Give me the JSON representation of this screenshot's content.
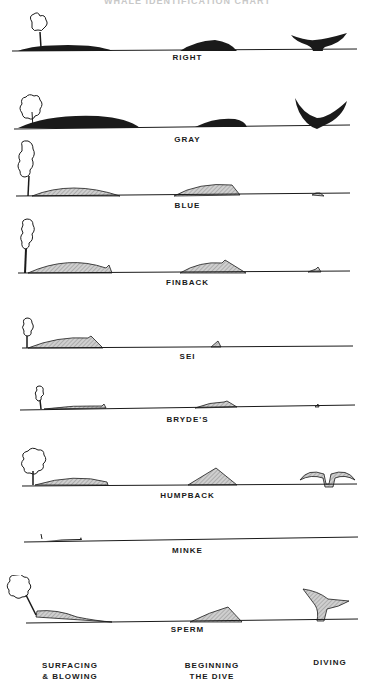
{
  "title": "WHALE IDENTIFICATION CHART",
  "species": [
    {
      "name": "RIGHT"
    },
    {
      "name": "GRAY"
    },
    {
      "name": "BLUE"
    },
    {
      "name": "FINBACK"
    },
    {
      "name": "SEI"
    },
    {
      "name": "BRYDE'S"
    },
    {
      "name": "HUMPBACK"
    },
    {
      "name": "MINKE"
    },
    {
      "name": "SPERM"
    }
  ],
  "stages": [
    {
      "label_line1": "SURFACING",
      "label_line2": "& BLOWING"
    },
    {
      "label_line1": "BEGINNING",
      "label_line2": "THE DIVE"
    },
    {
      "label_line1": "DIVING",
      "label_line2": ""
    }
  ],
  "colors": {
    "ink": "#1a1a1a",
    "hatch": "#bdbdbd",
    "background": "#ffffff"
  }
}
